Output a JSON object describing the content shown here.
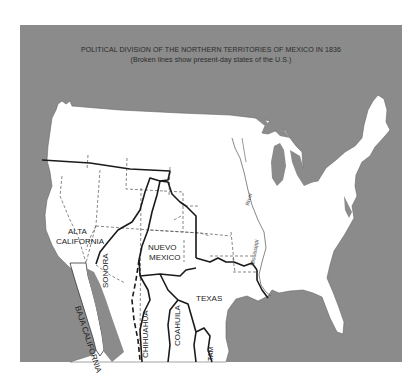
{
  "map": {
    "title": "POLITICAL DIVISION OF THE NORTHERN TERRITORIES OF MEXICO IN 1836",
    "subtitle": "(Broken lines show present-day states of the U.S.)",
    "colors": {
      "water": "#8b8b8b",
      "land": "#ffffff",
      "border": "#1a1a1a",
      "state_line": "#555555"
    },
    "territories": [
      {
        "name": "ALTA CALIFORNIA",
        "line1": "ALTA",
        "line2": "CALIFORNIA"
      },
      {
        "name": "BAJA CALIFORNIA"
      },
      {
        "name": "SONORA"
      },
      {
        "name": "NUEVO MEXICO",
        "line1": "NUEVO",
        "line2": "MEXICO"
      },
      {
        "name": "CHIHUAHUA"
      },
      {
        "name": "COAHUILA"
      },
      {
        "name": "TEXAS"
      },
      {
        "name": "TAM"
      }
    ],
    "river": {
      "word1": "River",
      "word2": "Mississippi"
    }
  }
}
